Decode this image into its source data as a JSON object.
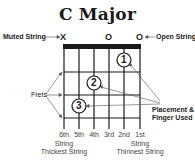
{
  "title": "C Major",
  "annotations": {
    "muted_string": "Muted String",
    "open_string": "Open String",
    "frets": "Frets",
    "placement_line1": "Placement &",
    "placement_line2": "Finger Used"
  },
  "string_markers": [
    {
      "string": "6th",
      "marker": "X"
    },
    {
      "string": "5th",
      "marker": ""
    },
    {
      "string": "4th",
      "marker": ""
    },
    {
      "string": "3rd",
      "marker": "O"
    },
    {
      "string": "2nd",
      "marker": ""
    },
    {
      "string": "1st",
      "marker": "O"
    }
  ],
  "string_labels": [
    "6th",
    "5th",
    "4th",
    "3rd",
    "2nd",
    "1st"
  ],
  "left_caption": {
    "line1": "String",
    "line2": "Thickest String"
  },
  "right_caption": {
    "line1": "String",
    "line2": "Thinnest String"
  },
  "fingers": [
    {
      "finger": "1",
      "string": "2nd",
      "fret": 1
    },
    {
      "finger": "2",
      "string": "4th",
      "fret": 2
    },
    {
      "finger": "3",
      "string": "5th",
      "fret": 3
    }
  ],
  "colors": {
    "line": "#1a1a1a",
    "text": "#222222",
    "pointer": "#777777"
  }
}
